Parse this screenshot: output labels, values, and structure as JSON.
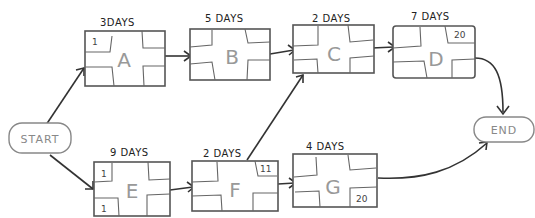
{
  "diagram": {
    "type": "network-diagram",
    "start": {
      "label": "START"
    },
    "end": {
      "label": "END"
    },
    "tasks": [
      {
        "id": "A",
        "label": "A",
        "duration": "3DAYS",
        "top_left": "1",
        "top_right": "",
        "bottom_left": "",
        "bottom_right": ""
      },
      {
        "id": "B",
        "label": "B",
        "duration": "5 DAYS",
        "top_left": "",
        "top_right": "",
        "bottom_left": "",
        "bottom_right": ""
      },
      {
        "id": "C",
        "label": "C",
        "duration": "2 DAYS",
        "top_left": "",
        "top_right": "",
        "bottom_left": "",
        "bottom_right": ""
      },
      {
        "id": "D",
        "label": "D",
        "duration": "7 DAYS",
        "top_left": "",
        "top_right": "20",
        "bottom_left": "",
        "bottom_right": ""
      },
      {
        "id": "E",
        "label": "E",
        "duration": "9 DAYS",
        "top_left": "1",
        "top_right": "",
        "bottom_left": "1",
        "bottom_right": ""
      },
      {
        "id": "F",
        "label": "F",
        "duration": "2 DAYS",
        "top_left": "",
        "top_right": "11",
        "bottom_left": "",
        "bottom_right": ""
      },
      {
        "id": "G",
        "label": "G",
        "duration": "4 DAYS",
        "top_left": "",
        "top_right": "",
        "bottom_left": "",
        "bottom_right": "20"
      }
    ],
    "edges": [
      {
        "from": "START",
        "to": "A"
      },
      {
        "from": "A",
        "to": "B"
      },
      {
        "from": "B",
        "to": "C"
      },
      {
        "from": "C",
        "to": "D"
      },
      {
        "from": "D",
        "to": "END"
      },
      {
        "from": "START",
        "to": "E"
      },
      {
        "from": "E",
        "to": "F"
      },
      {
        "from": "F",
        "to": "C"
      },
      {
        "from": "F",
        "to": "G"
      },
      {
        "from": "G",
        "to": "END"
      }
    ]
  }
}
